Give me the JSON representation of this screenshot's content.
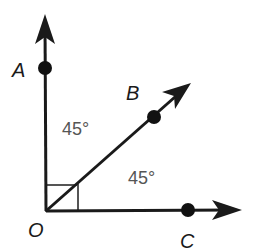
{
  "diagram": {
    "type": "angle-diagram",
    "vertex": {
      "label": "O",
      "x": 46,
      "y": 211
    },
    "rays": [
      {
        "name": "OA",
        "point_label": "A",
        "point": {
          "x": 45,
          "y": 68
        },
        "tip": {
          "x": 45,
          "y": 16
        }
      },
      {
        "name": "OB",
        "point_label": "B",
        "point": {
          "x": 154,
          "y": 117
        },
        "tip": {
          "x": 191,
          "y": 83
        }
      },
      {
        "name": "OC",
        "point_label": "C",
        "point": {
          "x": 188,
          "y": 210
        },
        "tip": {
          "x": 240,
          "y": 210
        }
      }
    ],
    "angles": [
      {
        "between": "OA-OB",
        "label": "45°"
      },
      {
        "between": "OB-OC",
        "label": "45°"
      }
    ],
    "right_angle_marker": true,
    "colors": {
      "lines": "#1a1a1a",
      "angle_text": "#555555",
      "marker": "#555555"
    }
  },
  "labels": {
    "A": "A",
    "B": "B",
    "C": "C",
    "O": "O",
    "angle1": "45°",
    "angle2": "45°"
  }
}
